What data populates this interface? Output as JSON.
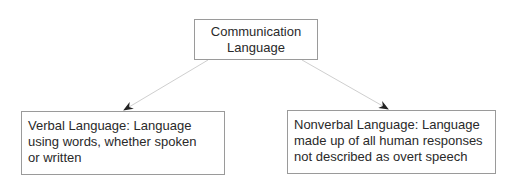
{
  "diagram": {
    "root": {
      "lines": [
        "Communication",
        "Language"
      ]
    },
    "children": [
      {
        "id": "verbal",
        "lines": [
          "Verbal Language: Language",
          "using words, whether spoken",
          "or written"
        ]
      },
      {
        "id": "nonverbal",
        "lines": [
          "Nonverbal Language: Language",
          "made up of all human responses",
          "not described as overt speech"
        ]
      }
    ],
    "edges": [
      {
        "from": "root",
        "to": "verbal"
      },
      {
        "from": "root",
        "to": "nonverbal"
      }
    ],
    "colors": {
      "box_border": "#9a9a9a",
      "edge_line": "#d0d0d0",
      "arrowhead": "#222222",
      "text": "#2a2a2a"
    }
  }
}
